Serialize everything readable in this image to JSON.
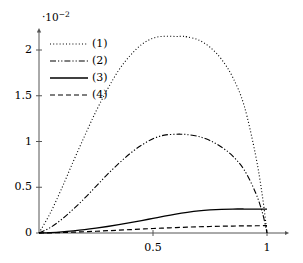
{
  "chart_data": {
    "type": "line",
    "title": "",
    "subtitle": "",
    "xlabel": "",
    "ylabel": "",
    "y_exponent_prefix": "·10",
    "y_exponent_power": "−2",
    "y_axis_multiplier_text": "·10⁻²",
    "xlim": [
      0,
      1.08
    ],
    "ylim": [
      0,
      0.0225
    ],
    "x_ticks": [
      0.5,
      1
    ],
    "x_tick_labels": [
      "0.5",
      "1"
    ],
    "y_ticks": [
      0,
      0.5,
      1,
      1.5,
      2
    ],
    "y_tick_labels": [
      "0",
      "0.5",
      "1",
      "1.5",
      "2"
    ],
    "y_tick_values_scaled": [
      0,
      0.005,
      0.01,
      0.015,
      0.02
    ],
    "grid": false,
    "legend_position": "upper-left-inside",
    "axis_arrows": true,
    "axis_color": "#555555",
    "curve_color": "#000000",
    "background_color": "#ffffff",
    "series": [
      {
        "name": "(1)",
        "style": "dotted",
        "dasharray": "1,2.2",
        "width": 1.1,
        "peak_x": 0.63,
        "peak_y": 0.0215,
        "end_y": 0,
        "x": [
          0.0,
          0.05,
          0.1,
          0.15,
          0.2,
          0.25,
          0.3,
          0.35,
          0.4,
          0.45,
          0.5,
          0.55,
          0.6,
          0.63,
          0.65,
          0.7,
          0.75,
          0.8,
          0.85,
          0.9,
          0.95,
          0.98,
          1.0
        ],
        "values": [
          0.0,
          0.0022,
          0.0049,
          0.0078,
          0.0106,
          0.0133,
          0.0157,
          0.0178,
          0.0194,
          0.0206,
          0.0213,
          0.0215,
          0.02148,
          0.0215,
          0.02143,
          0.0211,
          0.0203,
          0.019,
          0.017,
          0.0139,
          0.0085,
          0.004,
          0.0
        ]
      },
      {
        "name": "(2)",
        "style": "dash-dot-dot",
        "dasharray": "6,2,1.2,2,1.2,2",
        "width": 1.1,
        "peak_x": 0.62,
        "peak_y": 0.0108,
        "end_y": 0,
        "x": [
          0.0,
          0.05,
          0.1,
          0.15,
          0.2,
          0.25,
          0.3,
          0.35,
          0.4,
          0.45,
          0.5,
          0.55,
          0.6,
          0.62,
          0.65,
          0.7,
          0.75,
          0.8,
          0.85,
          0.9,
          0.95,
          0.98,
          1.0
        ],
        "values": [
          0.0,
          0.0006,
          0.0015,
          0.0026,
          0.0038,
          0.0051,
          0.0064,
          0.0076,
          0.0087,
          0.0096,
          0.0103,
          0.0107,
          0.01079,
          0.0108,
          0.01076,
          0.01055,
          0.0101,
          0.0094,
          0.0084,
          0.0069,
          0.0044,
          0.0022,
          0.0
        ]
      },
      {
        "name": "(3)",
        "style": "solid",
        "dasharray": "",
        "width": 1.3,
        "end_y": 0.0026,
        "x": [
          0.0,
          0.05,
          0.1,
          0.15,
          0.2,
          0.25,
          0.3,
          0.35,
          0.4,
          0.45,
          0.5,
          0.55,
          0.6,
          0.65,
          0.7,
          0.75,
          0.8,
          0.85,
          0.9,
          0.95,
          1.0
        ],
        "values": [
          0.0,
          5e-05,
          0.00013,
          0.00024,
          0.00037,
          0.00053,
          0.00071,
          0.00091,
          0.00113,
          0.00136,
          0.0016,
          0.00184,
          0.00206,
          0.00225,
          0.00241,
          0.00252,
          0.00259,
          0.00262,
          0.00262,
          0.00261,
          0.0026
        ]
      },
      {
        "name": "(4)",
        "style": "dashed",
        "dasharray": "5,3",
        "width": 1.2,
        "end_y": 0.0008,
        "x": [
          0.0,
          0.05,
          0.1,
          0.15,
          0.2,
          0.25,
          0.3,
          0.35,
          0.4,
          0.45,
          0.5,
          0.55,
          0.6,
          0.65,
          0.7,
          0.75,
          0.8,
          0.85,
          0.9,
          0.95,
          1.0
        ],
        "values": [
          0.0,
          2e-05,
          5e-05,
          9e-05,
          0.00014,
          0.00019,
          0.00025,
          0.00031,
          0.00037,
          0.00043,
          0.00049,
          0.00054,
          0.00059,
          0.00064,
          0.00068,
          0.00071,
          0.00074,
          0.00076,
          0.00078,
          0.00079,
          0.0008
        ]
      }
    ]
  },
  "legend": {
    "items": [
      {
        "label": "(1)",
        "style": "dotted"
      },
      {
        "label": "(2)",
        "style": "dash-dot-dot"
      },
      {
        "label": "(3)",
        "style": "solid"
      },
      {
        "label": "(4)",
        "style": "dashed"
      }
    ]
  }
}
